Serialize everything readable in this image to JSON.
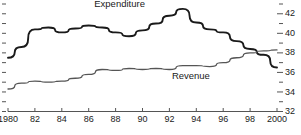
{
  "chart_data": {
    "type": "line",
    "title": "",
    "xlabel": "",
    "ylabel": "",
    "xlim": [
      1980,
      2000
    ],
    "ylim": [
      32,
      43
    ],
    "grid": false,
    "legend_position": "inline-annotations",
    "y_axis_side": "right",
    "y_ticks_major": [
      42,
      40,
      38,
      36,
      34,
      32
    ],
    "y_tick_labels": [
      "42",
      "40",
      "38",
      "36",
      "34",
      "32"
    ],
    "y_ticks_minor": [
      43,
      41,
      39,
      37,
      35,
      33
    ],
    "x_ticks": [
      1980,
      1982,
      1984,
      1986,
      1988,
      1990,
      1992,
      1994,
      1996,
      1998,
      2000
    ],
    "x_tick_labels": [
      "1980",
      "82",
      "84",
      "86",
      "88",
      "90",
      "92",
      "94",
      "96",
      "98",
      "2000"
    ],
    "x": [
      1980,
      1981,
      1982,
      1983,
      1984,
      1985,
      1986,
      1987,
      1988,
      1989,
      1990,
      1991,
      1992,
      1993,
      1994,
      1995,
      1996,
      1997,
      1998,
      1999,
      2000
    ],
    "series": [
      {
        "name": "Expenditure",
        "color": "#1a1a1a",
        "width": 1.9,
        "label_x": 1988.3,
        "label_y": 43.0,
        "values": [
          37.5,
          38.6,
          40.4,
          40.6,
          40.1,
          40.5,
          40.8,
          40.6,
          40.1,
          39.7,
          40.3,
          41.0,
          41.8,
          42.5,
          41.1,
          40.4,
          40.1,
          39.2,
          38.4,
          37.8,
          36.5
        ]
      },
      {
        "name": "Revenue",
        "color": "#555555",
        "width": 1.3,
        "label_x": 1993.6,
        "label_y": 35.6,
        "values": [
          34.3,
          34.9,
          35.1,
          35.0,
          35.1,
          35.4,
          35.8,
          36.3,
          36.2,
          36.4,
          36.3,
          36.4,
          36.3,
          36.7,
          36.7,
          36.6,
          37.0,
          37.5,
          38.0,
          38.2,
          38.3
        ]
      }
    ]
  },
  "axis_style": {
    "axis_color": "#555555",
    "tick_color": "#555555",
    "text_color": "#1a1a1a"
  }
}
